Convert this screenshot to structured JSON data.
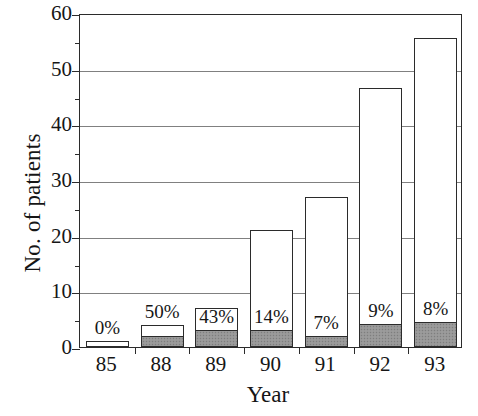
{
  "chart_data": {
    "type": "bar",
    "subtype": "stacked",
    "title": "",
    "xlabel": "Year",
    "ylabel": "No. of patients",
    "categories": [
      "85",
      "88",
      "89",
      "90",
      "91",
      "92",
      "93"
    ],
    "ylim": [
      0,
      60
    ],
    "y_ticks_major": [
      0,
      10,
      20,
      30,
      40,
      50,
      60
    ],
    "y_ticks_minor": [
      5,
      15,
      25,
      35,
      45,
      55
    ],
    "y_tick_labels": [
      "0",
      "10",
      "20",
      "30",
      "40",
      "50",
      "60"
    ],
    "grid": "horizontal-major",
    "legend": "none",
    "series": [
      {
        "name": "shaded-subgroup",
        "fill": "gray-hatched",
        "values": [
          0,
          2,
          3,
          3,
          2,
          4.2,
          4.5
        ]
      },
      {
        "name": "total",
        "fill": "white",
        "values": [
          1,
          4,
          7,
          21,
          27,
          46.5,
          55.5
        ]
      }
    ],
    "annotations": [
      {
        "category": "85",
        "text": "0%",
        "position": "above-bar"
      },
      {
        "category": "88",
        "text": "50%",
        "position": "above-bar"
      },
      {
        "category": "89",
        "text": "43%",
        "position": "inside-bar"
      },
      {
        "category": "90",
        "text": "14%",
        "position": "inside-bar"
      },
      {
        "category": "91",
        "text": "7%",
        "position": "inside-bar"
      },
      {
        "category": "92",
        "text": "9%",
        "position": "inside-bar"
      },
      {
        "category": "93",
        "text": "8%",
        "position": "inside-bar"
      }
    ],
    "colors": {
      "axis": "#2b2b2b",
      "grid": "#808080",
      "bar_fill": "#ffffff",
      "bar_shaded_fill": "#969696",
      "text": "#161616",
      "background": "#ffffff"
    }
  }
}
